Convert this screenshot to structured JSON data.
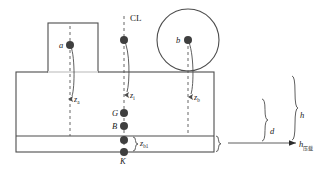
{
  "diagram": {
    "colors": {
      "outline": "#4d4d4d",
      "dashed": "#555555",
      "marker": "#3f3f3f",
      "text": "#1a1a1a",
      "background": "#ffffff"
    },
    "centerline": {
      "label": "CL"
    },
    "points": [
      {
        "id": "a",
        "label": "a",
        "x": 70,
        "y": 45,
        "label_dx": -8,
        "label_dy": 2
      },
      {
        "id": "b",
        "label": "b",
        "x": 188,
        "y": 40,
        "label_dx": -9,
        "label_dy": 2
      },
      {
        "id": "cl",
        "label": "",
        "x": 124,
        "y": 40,
        "label_dx": 0,
        "label_dy": 0
      },
      {
        "id": "G",
        "label": "G",
        "x": 124,
        "y": 113,
        "label_dx": -9,
        "label_dy": 2
      },
      {
        "id": "B",
        "label": "B",
        "x": 124,
        "y": 126,
        "label_dx": -9,
        "label_dy": 2
      },
      {
        "id": "m",
        "label": "",
        "x": 124,
        "y": 140,
        "label_dx": 0,
        "label_dy": 0
      },
      {
        "id": "K",
        "label": "K",
        "x": 124,
        "y": 152,
        "label_dx": -2,
        "label_dy": 11
      }
    ],
    "depth_leaders": [
      {
        "id": "za",
        "base": "z",
        "sub": "a",
        "x": 70,
        "label_x": 74,
        "label_y": 102
      },
      {
        "id": "zi",
        "base": "z",
        "sub": "i",
        "x": 124,
        "label_x": 130,
        "label_y": 97
      },
      {
        "id": "zb",
        "base": "z",
        "sub": "b",
        "x": 188,
        "label_x": 194,
        "label_y": 99
      }
    ],
    "tank_height": {
      "base": "z",
      "sub": "b1",
      "label_x": 140,
      "label_y": 146
    },
    "dimensions": [
      {
        "id": "d",
        "base": "d",
        "sub": "",
        "label_x": 270,
        "label_y": 134
      },
      {
        "id": "h",
        "base": "h",
        "sub": "",
        "label_x": 300,
        "label_y": 118
      }
    ],
    "ballast_arrow": {
      "base": "h",
      "sub": "压载",
      "label_x": 302,
      "label_y": 150
    },
    "hull": {
      "left": 16,
      "right": 214,
      "deck_y": 72,
      "bottom_y": 152,
      "tank_top_y": 136
    },
    "superstructure": {
      "left": 48,
      "right": 98,
      "top": 23,
      "bottom": 72
    },
    "circle": {
      "cx": 188,
      "cy": 40,
      "r": 31
    }
  }
}
